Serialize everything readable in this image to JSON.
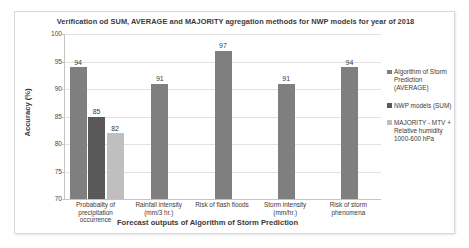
{
  "chart_data": {
    "type": "bar",
    "title": "Verification od SUM, AVERAGE and MAJORITY agregation methods for NWP models for year of 2018",
    "xlabel": "Forecast outputs of Algorithm of Storm Prediction",
    "ylabel": "Accuracy (%)",
    "ylim": [
      70,
      100
    ],
    "ytick_step": 5,
    "yticks": [
      "100",
      "95",
      "90",
      "85",
      "80",
      "75",
      "70"
    ],
    "grid": true,
    "legend_position": "right",
    "categories": [
      "Probabality of precipitation occurrence",
      "Rainfall intensity (mm/3 hr.)",
      "Risk of flash floods",
      "Storm intensity (mm/hr.)",
      "Risk of storm phenomena"
    ],
    "series": [
      {
        "name": "Algorithm of Storm Prediction (AVERAGE)",
        "color": "#7f7f7f",
        "values": [
          94,
          91,
          97,
          91,
          94
        ]
      },
      {
        "name": "NWP models (SUM)",
        "color": "#595959",
        "values": [
          85,
          null,
          null,
          null,
          null
        ]
      },
      {
        "name": "MAJORITY - MTV + Relative humidity 1000-600 hPa",
        "color": "#bfbfbf",
        "values": [
          82,
          null,
          null,
          null,
          null
        ]
      }
    ],
    "data_labels": [
      [
        "94",
        "85",
        "82"
      ],
      [
        "91"
      ],
      [
        "97"
      ],
      [
        "91"
      ],
      [
        "94"
      ]
    ]
  },
  "legend": {
    "items": [
      {
        "label": "Algorithm of Storm Prediction (AVERAGE)"
      },
      {
        "label": "NWP models (SUM)"
      },
      {
        "label": "MAJORITY - MTV + Relative humidity 1000-600 hPa"
      }
    ]
  }
}
